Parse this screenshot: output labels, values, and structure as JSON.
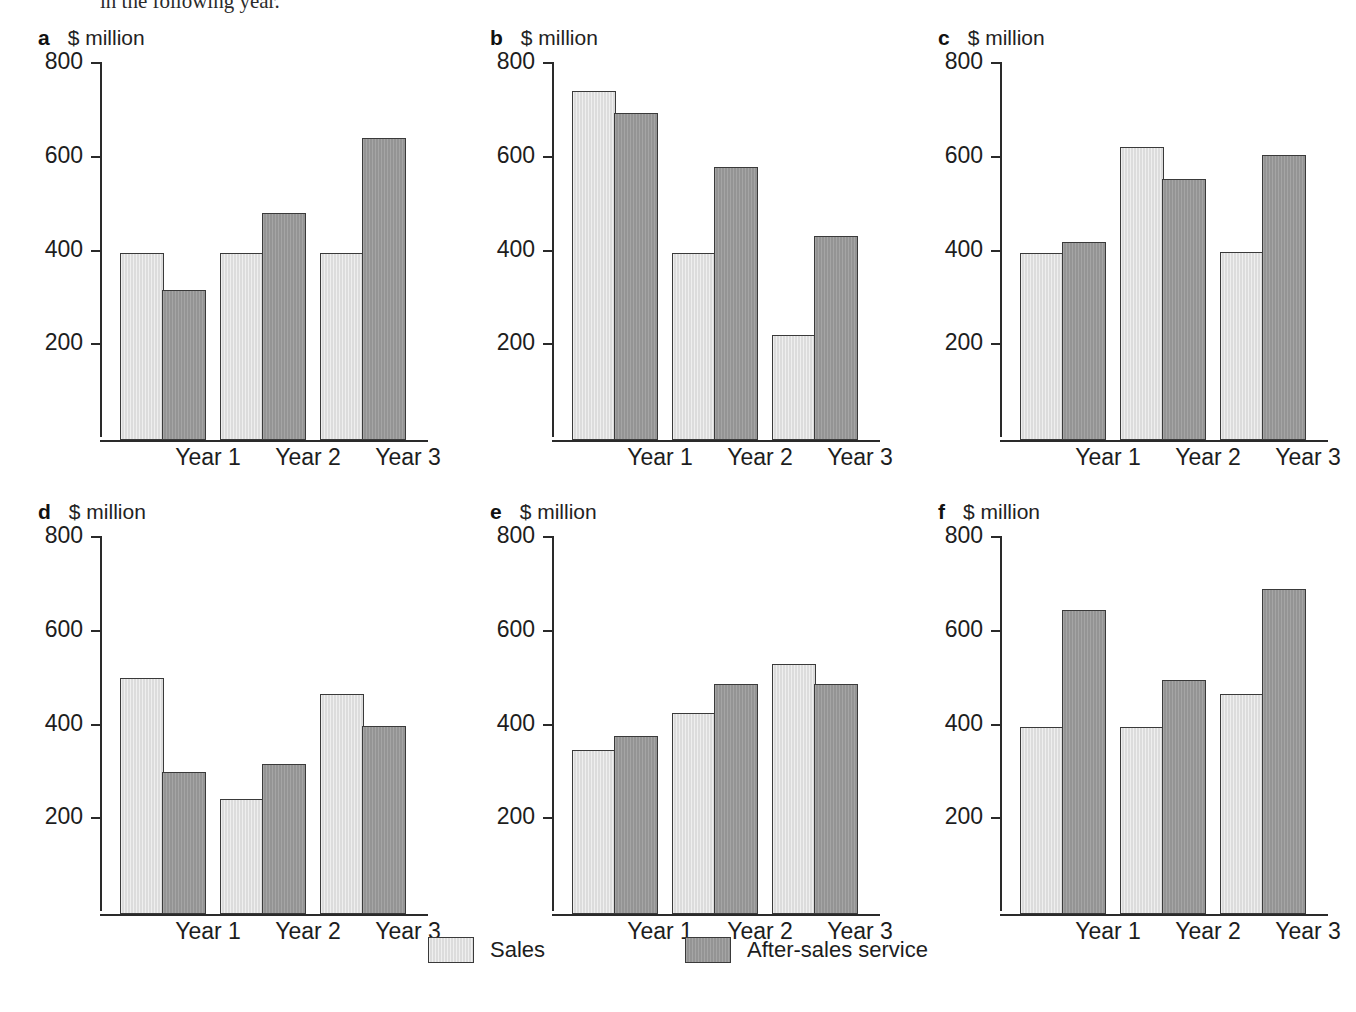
{
  "page": {
    "top_text_fragment": "in the following year.",
    "background_color": "#ffffff"
  },
  "legend": {
    "items": [
      {
        "label": "Sales",
        "swatch": "light-gray-swatch",
        "color": "#dcdcdc"
      },
      {
        "label": "After-sales service",
        "swatch": "dark-gray-swatch",
        "color": "#949494"
      }
    ]
  },
  "axis": {
    "unit_label": "$ million",
    "y_ticks": [
      "800",
      "600",
      "400",
      "200"
    ],
    "x_categories": [
      "Year 1",
      "Year 2",
      "Year 3"
    ]
  },
  "panels": [
    {
      "letter": "a",
      "unit": "$ million"
    },
    {
      "letter": "b",
      "unit": "$ million"
    },
    {
      "letter": "c",
      "unit": "$ million"
    },
    {
      "letter": "d",
      "unit": "$ million"
    },
    {
      "letter": "e",
      "unit": "$ million"
    },
    {
      "letter": "f",
      "unit": "$ million"
    }
  ],
  "chart_data": [
    {
      "id": "a",
      "type": "bar",
      "title": "a",
      "xlabel": "",
      "ylabel": "$ million",
      "ylim": [
        0,
        800
      ],
      "yticks": [
        200,
        400,
        600,
        800
      ],
      "grid": false,
      "legend_position": "bottom-shared",
      "categories": [
        "Year 1",
        "Year 2",
        "Year 3"
      ],
      "series": [
        {
          "name": "Sales",
          "values": [
            400,
            400,
            400
          ]
        },
        {
          "name": "After-sales service",
          "values": [
            320,
            485,
            645
          ]
        }
      ]
    },
    {
      "id": "b",
      "type": "bar",
      "title": "b",
      "xlabel": "",
      "ylabel": "$ million",
      "ylim": [
        0,
        800
      ],
      "yticks": [
        200,
        400,
        600,
        800
      ],
      "grid": false,
      "legend_position": "bottom-shared",
      "categories": [
        "Year 1",
        "Year 2",
        "Year 3"
      ],
      "series": [
        {
          "name": "Sales",
          "values": [
            745,
            400,
            225
          ]
        },
        {
          "name": "After-sales service",
          "values": [
            697,
            583,
            435
          ]
        }
      ]
    },
    {
      "id": "c",
      "type": "bar",
      "title": "c",
      "xlabel": "",
      "ylabel": "$ million",
      "ylim": [
        0,
        800
      ],
      "yticks": [
        200,
        400,
        600,
        800
      ],
      "grid": false,
      "legend_position": "bottom-shared",
      "categories": [
        "Year 1",
        "Year 2",
        "Year 3"
      ],
      "series": [
        {
          "name": "Sales",
          "values": [
            400,
            625,
            402
          ]
        },
        {
          "name": "After-sales service",
          "values": [
            422,
            556,
            608
          ]
        }
      ]
    },
    {
      "id": "d",
      "type": "bar",
      "title": "d",
      "xlabel": "",
      "ylabel": "$ million",
      "ylim": [
        0,
        800
      ],
      "yticks": [
        200,
        400,
        600,
        800
      ],
      "grid": false,
      "legend_position": "bottom-shared",
      "categories": [
        "Year 1",
        "Year 2",
        "Year 3"
      ],
      "series": [
        {
          "name": "Sales",
          "values": [
            503,
            245,
            470
          ]
        },
        {
          "name": "After-sales service",
          "values": [
            302,
            320,
            402
          ]
        }
      ]
    },
    {
      "id": "e",
      "type": "bar",
      "title": "e",
      "xlabel": "",
      "ylabel": "$ million",
      "ylim": [
        0,
        800
      ],
      "yticks": [
        200,
        400,
        600,
        800
      ],
      "grid": false,
      "legend_position": "bottom-shared",
      "categories": [
        "Year 1",
        "Year 2",
        "Year 3"
      ],
      "series": [
        {
          "name": "Sales",
          "values": [
            350,
            428,
            533
          ]
        },
        {
          "name": "After-sales service",
          "values": [
            380,
            490,
            490
          ]
        }
      ]
    },
    {
      "id": "f",
      "type": "bar",
      "title": "f",
      "xlabel": "",
      "ylabel": "$ million",
      "ylim": [
        0,
        800
      ],
      "yticks": [
        200,
        400,
        600,
        800
      ],
      "grid": false,
      "legend_position": "bottom-shared",
      "categories": [
        "Year 1",
        "Year 2",
        "Year 3"
      ],
      "series": [
        {
          "name": "Sales",
          "values": [
            400,
            400,
            470
          ]
        },
        {
          "name": "After-sales service",
          "values": [
            648,
            500,
            694
          ]
        }
      ]
    }
  ]
}
